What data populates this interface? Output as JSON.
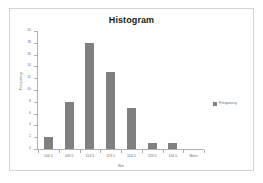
{
  "chart_data": {
    "type": "bar",
    "title": "Histogram",
    "xlabel": "Bin",
    "ylabel": "Frequency",
    "categories": [
      "104.5",
      "109.5",
      "114.5",
      "119.5",
      "124.5",
      "129.5",
      "134.5",
      "More"
    ],
    "values": [
      2,
      8,
      18,
      13,
      7,
      1,
      1,
      0
    ],
    "series": [
      {
        "name": "Frequency",
        "values": [
          2,
          8,
          18,
          13,
          7,
          1,
          1,
          0
        ]
      }
    ],
    "ylim": [
      0,
      20
    ],
    "ytick_step": 2,
    "yticks": [
      "0",
      "2",
      "4",
      "6",
      "8",
      "10",
      "12",
      "14",
      "16",
      "18",
      "20"
    ],
    "grid": false,
    "legend": {
      "position": "right",
      "entries": [
        "Frequency"
      ]
    },
    "colors": {
      "bar": "#808080",
      "axis": "#b0b0b0",
      "text": "#6e6e6e",
      "title": "#1a1a1a",
      "border": "#d4d4d4",
      "background": "#ffffff"
    }
  }
}
